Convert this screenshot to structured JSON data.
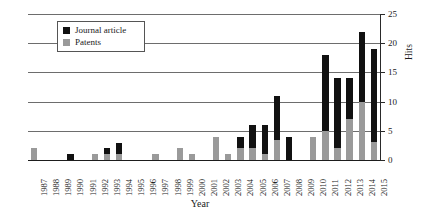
{
  "chart_data": {
    "type": "bar",
    "title": "",
    "subtitle": "",
    "xlabel": "Year",
    "ylabel": "Hits",
    "stacked": true,
    "grid": true,
    "legend_position": "upper-left-inside",
    "ylim": [
      0,
      25
    ],
    "yticks": [
      0,
      5,
      10,
      15,
      20,
      25
    ],
    "ytick_labels": [
      "0",
      "5",
      "10",
      "15",
      "20",
      "25"
    ],
    "yaxis_side": "right",
    "categories": [
      "1987",
      "1988",
      "1989",
      "1990",
      "1991",
      "1992",
      "1993",
      "1994",
      "1995",
      "1996",
      "1997",
      "1998",
      "1999",
      "2000",
      "2001",
      "2002",
      "2003",
      "2004",
      "2005",
      "2006",
      "2007",
      "2008",
      "2009",
      "2010",
      "2011",
      "2012",
      "2013",
      "2014",
      "2015"
    ],
    "series": [
      {
        "name": "Patents",
        "color": "#9a9a9a",
        "values": [
          2,
          0,
          0,
          0,
          0,
          1,
          1,
          1,
          0,
          0,
          1,
          0,
          2,
          1,
          0,
          4,
          1,
          2,
          2,
          1,
          3.5,
          0,
          0,
          4,
          5,
          2,
          7,
          10,
          3
        ]
      },
      {
        "name": "Journal article",
        "color": "#111111",
        "values": [
          0,
          0,
          0,
          1,
          0,
          0,
          1,
          2,
          0,
          0,
          0,
          0,
          0,
          0,
          0,
          0,
          0,
          2,
          4,
          5,
          7.5,
          4,
          0,
          0,
          13,
          12,
          7,
          12,
          16
        ]
      }
    ],
    "totals": [
      2,
      0,
      0,
      1,
      0,
      1,
      2,
      3,
      0,
      0,
      1,
      0,
      2,
      1,
      0,
      4,
      1,
      4,
      6,
      6,
      11,
      4,
      0,
      4,
      18,
      14,
      14,
      22,
      19
    ]
  },
  "legend": {
    "items": [
      {
        "label": "Journal article",
        "swatch": "black-square-icon"
      },
      {
        "label": "Patents",
        "swatch": "gray-square-icon"
      }
    ]
  },
  "axes": {
    "x_title": "Year",
    "y_title": "Hits"
  }
}
